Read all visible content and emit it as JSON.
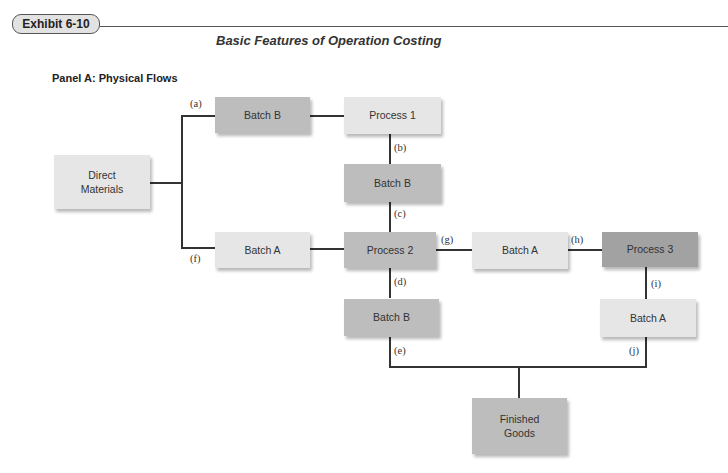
{
  "header": {
    "exhibit_label": "Exhibit 6-10",
    "title": "Basic Features of Operation Costing"
  },
  "panel": {
    "title": "Panel A: Physical Flows"
  },
  "nodes": {
    "direct_materials": {
      "line1": "Direct",
      "line2": "Materials"
    },
    "batch_b_top": "Batch B",
    "process_1": "Process 1",
    "batch_b_mid": "Batch B",
    "batch_a_left": "Batch A",
    "process_2": "Process 2",
    "batch_a_mid": "Batch A",
    "process_3": "Process 3",
    "batch_b_bottom": "Batch B",
    "batch_a_right": "Batch A",
    "finished_goods": {
      "line1": "Finished",
      "line2": "Goods"
    }
  },
  "flow_labels": {
    "a": "(a)",
    "b": "(b)",
    "c": "(c)",
    "d": "(d)",
    "e": "(e)",
    "f": "(f)",
    "g": "(g)",
    "h": "(h)",
    "i": "(i)",
    "j": "(j)"
  },
  "colors": {
    "light_box": "#e6e6e6",
    "mid_box": "#bdbdbd",
    "dark_box": "#a2a2a2",
    "line": "#333333"
  }
}
